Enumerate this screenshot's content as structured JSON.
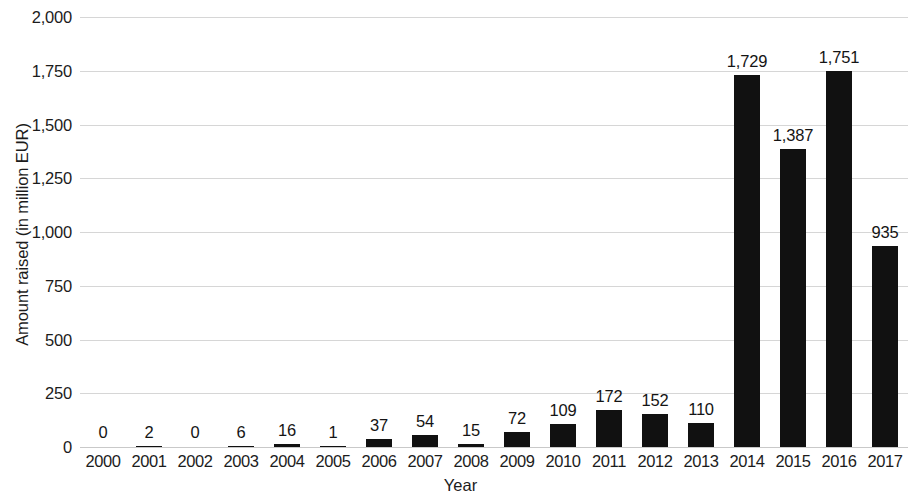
{
  "chart_data": {
    "type": "bar",
    "title": "",
    "subtitle": "",
    "xlabel": "Year",
    "ylabel": "Amount raised (in million EUR)",
    "categories": [
      "2000",
      "2001",
      "2002",
      "2003",
      "2004",
      "2005",
      "2006",
      "2007",
      "2008",
      "2009",
      "2010",
      "2011",
      "2012",
      "2013",
      "2014",
      "2015",
      "2016",
      "2017"
    ],
    "values": [
      0,
      2,
      0,
      6,
      16,
      1,
      37,
      54,
      15,
      72,
      109,
      172,
      152,
      110,
      1729,
      1387,
      1751,
      935
    ],
    "value_labels": [
      "0",
      "2",
      "0",
      "6",
      "16",
      "1",
      "37",
      "54",
      "15",
      "72",
      "109",
      "172",
      "152",
      "110",
      "1,729",
      "1,387",
      "1,751",
      "935"
    ],
    "ylim": [
      0,
      2000
    ],
    "ytick_values": [
      2000,
      1750,
      1500,
      1250,
      1000,
      750,
      500,
      250,
      0
    ],
    "ytick_labels": [
      "2,000",
      "1,750",
      "1,500",
      "1,250",
      "1,000",
      "750",
      "500",
      "250",
      "0"
    ],
    "grid": true,
    "legend": null,
    "legend_position": "none",
    "bar_color": "#111111",
    "gridline_color": "#d6d6d6",
    "background_color": "#ffffff",
    "data_labels_shown": true
  }
}
